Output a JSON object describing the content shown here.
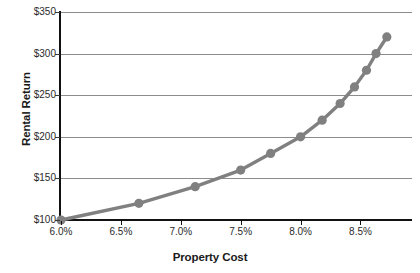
{
  "chart_data": {
    "type": "line",
    "title": "",
    "xlabel": "Property Cost",
    "ylabel": "Rental Return",
    "xlim": [
      6.0,
      8.93
    ],
    "ylim": [
      100,
      350
    ],
    "grid": true,
    "legend": "none",
    "marker": "circle",
    "series_color": "#808080",
    "gridline_color": "#8c8c8c",
    "axis_color": "#111111",
    "x_tick_labels": [
      "6.0%",
      "6.5%",
      "7.0%",
      "7.5%",
      "8.0%",
      "8.5%"
    ],
    "x_tick_values": [
      6.0,
      6.5,
      7.0,
      7.5,
      8.0,
      8.5
    ],
    "y_tick_labels": [
      "$100",
      "$150",
      "$200",
      "$250",
      "$300",
      "$350"
    ],
    "y_tick_values": [
      100,
      150,
      200,
      250,
      300,
      350
    ],
    "series": [
      {
        "name": "Rental Return vs Property Cost",
        "x": [
          6.0,
          6.65,
          7.12,
          7.5,
          7.75,
          8.0,
          8.18,
          8.33,
          8.45,
          8.55,
          8.63,
          8.72
        ],
        "y": [
          100,
          120,
          140,
          160,
          180,
          200,
          220,
          240,
          260,
          280,
          300,
          320
        ]
      }
    ]
  }
}
